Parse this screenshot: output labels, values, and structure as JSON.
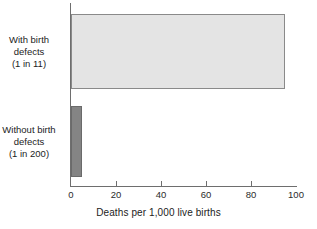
{
  "chart_data": {
    "type": "bar",
    "orientation": "horizontal",
    "title": "",
    "xlabel": "Deaths per 1,000 live births",
    "ylabel": "",
    "xlim": [
      0,
      100
    ],
    "grid": false,
    "legend": "none",
    "categories": [
      "With birth defects (1 in 11)",
      "Without birth defects (1 in 200)"
    ],
    "values": [
      95,
      5
    ],
    "ticks": [
      {
        "value": 0,
        "label": "0"
      },
      {
        "value": 20,
        "label": "20"
      },
      {
        "value": 40,
        "label": "40"
      },
      {
        "value": 60,
        "label": "60"
      },
      {
        "value": 80,
        "label": "80"
      },
      {
        "value": 100,
        "label": "100"
      }
    ],
    "bars": [
      {
        "name": "with-birth-defects",
        "value": 95,
        "color": "#e4e4e4",
        "border_color": "#8a8a8a",
        "label_lines": [
          "With birth",
          "defects",
          "(1 in 11)"
        ]
      },
      {
        "name": "without-birth-defects",
        "value": 5,
        "color": "#848484",
        "border_color": "#6a6a6a",
        "label_lines": [
          "Without birth",
          "defects",
          "(1 in 200)"
        ]
      }
    ],
    "axis_color": "#6e6e6e",
    "text_color": "#1c1c1c",
    "background": "#ffffff"
  }
}
